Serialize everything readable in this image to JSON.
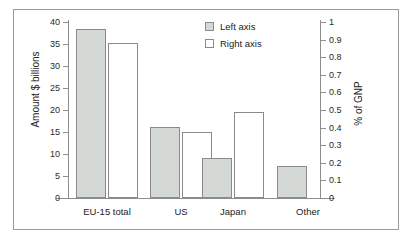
{
  "chart_data": {
    "type": "bar",
    "title": "",
    "subtitle": "",
    "categories": [
      "EU-15 total",
      "US",
      "Japan",
      "Other"
    ],
    "series": [
      {
        "name": "Left axis",
        "axis": "left",
        "fill": "#d5d9d6",
        "values": [
          38.4,
          16.1,
          9.1,
          7.3
        ]
      },
      {
        "name": "Right axis",
        "axis": "right",
        "fill": "#ffffff",
        "values": [
          0.88,
          0.375,
          0.49,
          null
        ]
      }
    ],
    "left_axis": {
      "label": "Amount $ billions",
      "min": 0,
      "max": 40,
      "step": 5,
      "ticks": [
        "0",
        "5",
        "10",
        "15",
        "20",
        "25",
        "30",
        "35",
        "40"
      ]
    },
    "right_axis": {
      "label": "% of GNP",
      "min": 0,
      "max": 1,
      "step": 0.1,
      "ticks": [
        "0",
        "0.1",
        "0.2",
        "0.3",
        "0.4",
        "0.5",
        "0.6",
        "0.7",
        "0.8",
        "0.9",
        "1"
      ]
    },
    "xlabel": "",
    "grid": false,
    "legend_position": "top-center",
    "legend": [
      {
        "label": "Left axis",
        "fill": "#d5d9d6"
      },
      {
        "label": "Right axis",
        "fill": "#ffffff"
      }
    ],
    "colors": {
      "bar_gray": "#d5d9d6",
      "bar_white": "#ffffff",
      "bar_border": "#8a8a8a",
      "axis": "#8e8e8e",
      "frame": "#9a9a9a",
      "text": "#222222",
      "background": "#ffffff"
    }
  }
}
